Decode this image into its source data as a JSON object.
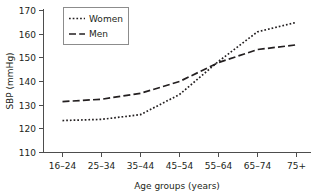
{
  "chart_data": {
    "type": "line",
    "title": "",
    "xlabel": "Age groups (years)",
    "ylabel": "SBP (mmHg)",
    "categories": [
      "16–24",
      "25–34",
      "35–44",
      "45–54",
      "55–64",
      "65–74",
      "75+"
    ],
    "ylim": [
      110,
      170
    ],
    "yticks": [
      110,
      120,
      130,
      140,
      150,
      160,
      170
    ],
    "ytick_labels": [
      "110",
      "120",
      "130",
      "140",
      "150",
      "160",
      "170"
    ],
    "grid": false,
    "legend_position": "top-left",
    "series": [
      {
        "name": "Women",
        "style": "dotted",
        "color": "#231f20",
        "values": [
          123.5,
          124.0,
          126.0,
          134.5,
          148.5,
          161.0,
          165.0
        ]
      },
      {
        "name": "Men",
        "style": "dashed",
        "color": "#231f20",
        "values": [
          131.5,
          132.5,
          135.0,
          140.0,
          148.0,
          153.5,
          155.5
        ]
      }
    ]
  },
  "axes": {
    "y_axis_label": "SBP (mmHg)",
    "x_axis_label": "Age groups (years)"
  },
  "legend": {
    "entries": [
      {
        "label": "Women"
      },
      {
        "label": "Men"
      }
    ]
  }
}
